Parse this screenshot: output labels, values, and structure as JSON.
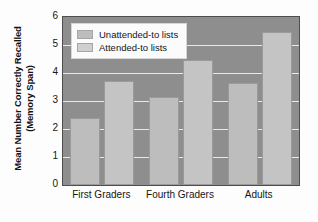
{
  "chart_data": {
    "type": "bar",
    "title": "",
    "xlabel": "",
    "ylabel_line1": "Mean Number Correctly Recalled",
    "ylabel_line2": "(Memory Span)",
    "categories": [
      "First Graders",
      "Fourth Graders",
      "Adults"
    ],
    "series": [
      {
        "name": "Unattended-to lists",
        "values": [
          2.4,
          3.15,
          3.65
        ],
        "color": "#bdbdbd"
      },
      {
        "name": "Attended-to lists",
        "values": [
          3.7,
          4.45,
          5.45
        ],
        "color": "#c4c4c4"
      }
    ],
    "ylim": [
      0,
      6
    ],
    "yticks": [
      0,
      1,
      2,
      3,
      4,
      5,
      6
    ],
    "ytick_labels": [
      "0",
      "1",
      "2",
      "3",
      "4",
      "5",
      "6"
    ],
    "grid": true,
    "grid_color": "#e9e9e9",
    "legend_position": "top-left",
    "plot_background": "#8e8e8e",
    "figure_background": "#fdfdfd",
    "axis_color": "#4e4e4e"
  }
}
